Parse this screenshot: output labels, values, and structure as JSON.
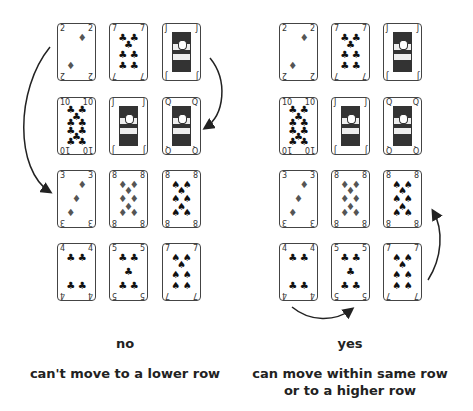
{
  "left_panel": {
    "verdict": "no",
    "caption": "can't move to a lower row",
    "rows": [
      [
        "2 diamonds",
        "7 clubs",
        "J hearts"
      ],
      [
        "10 clubs",
        "J diamonds",
        "Q hearts"
      ],
      [
        "3 diamonds",
        "8 diamonds",
        "8 spades"
      ],
      [
        "4 clubs",
        "5 clubs",
        "7 spades"
      ]
    ]
  },
  "right_panel": {
    "verdict": "yes",
    "caption_line1": "can move within same row",
    "caption_line2": "or to a higher row",
    "rows": [
      [
        "2 diamonds",
        "7 clubs",
        "J hearts"
      ],
      [
        "10 clubs",
        "J diamonds",
        "Q hearts"
      ],
      [
        "3 diamonds",
        "8 diamonds",
        "8 spades"
      ],
      [
        "4 clubs",
        "5 clubs",
        "7 spades"
      ]
    ]
  },
  "cards": [
    {
      "rank": "2",
      "suit": "♦"
    },
    {
      "rank": "7",
      "suit": "♣"
    },
    {
      "rank": "J",
      "suit": "♥"
    },
    {
      "rank": "10",
      "suit": "♣"
    },
    {
      "rank": "J",
      "suit": "♦"
    },
    {
      "rank": "Q",
      "suit": "♥"
    },
    {
      "rank": "3",
      "suit": "♦"
    },
    {
      "rank": "8",
      "suit": "♦"
    },
    {
      "rank": "8",
      "suit": "♠"
    },
    {
      "rank": "4",
      "suit": "♣"
    },
    {
      "rank": "5",
      "suit": "♣"
    },
    {
      "rank": "7",
      "suit": "♠"
    }
  ]
}
